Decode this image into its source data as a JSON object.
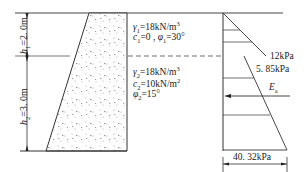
{
  "diagram": {
    "layer1": {
      "height_label": "h",
      "height_sub": "1",
      "height_value": "=2. 0m",
      "gamma_sym": "γ",
      "gamma_sub": "1",
      "gamma_val": "=18kN/m",
      "gamma_sup": "3",
      "c_sym": "c",
      "c_sub": "1",
      "c_val": "=0 , ",
      "phi_sym": "φ",
      "phi_sub": "1",
      "phi_val": "=30°"
    },
    "layer2": {
      "height_label": "h",
      "height_sub": "2",
      "height_value": "=3. 0m",
      "gamma_sym": "γ",
      "gamma_sub": "2",
      "gamma_val": "=18kN/m",
      "gamma_sup": "3",
      "c_sym": "c",
      "c_sub": "2",
      "c_val": "=10kN/m",
      "c_sup": "2",
      "phi_sym": "φ",
      "phi_sub": "2",
      "phi_val": "=15°"
    },
    "pressure": {
      "p1": "12kPa",
      "p2": "5. 85kPa",
      "p3": "40. 32kPa",
      "resultant_sym": "E",
      "resultant_sub": "a"
    },
    "colors": {
      "line": "#333333",
      "fill_dots": "#888888"
    }
  }
}
